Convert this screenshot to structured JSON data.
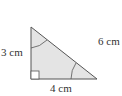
{
  "diagram": {
    "type": "right-triangle",
    "vertices": {
      "top": [
        31,
        27
      ],
      "right_angle": [
        31,
        79
      ],
      "right": [
        97,
        79
      ]
    },
    "colors": {
      "fill": "#e4e4e4",
      "stroke": "#555555",
      "text": "#333333"
    },
    "labels": {
      "left_side": "3 cm",
      "bottom_side": "4 cm",
      "hypotenuse": "6 cm"
    },
    "markers": {
      "right_angle_square": true,
      "angle_arcs": [
        "top-vertex",
        "right-vertex"
      ]
    }
  }
}
